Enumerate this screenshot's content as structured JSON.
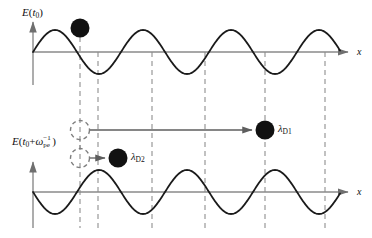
{
  "figure": {
    "background_color": "#ffffff",
    "width": 372,
    "height": 238
  },
  "colors": {
    "curve": "#1a1a1a",
    "axis": "#8a8a8a",
    "dashed": "#8f8f8f",
    "particle_fill": "#111111",
    "arrow": "#6f6f6f",
    "text": "#111111"
  },
  "panels": {
    "top": {
      "y_axis_label": {
        "E": "E",
        "open_paren": "(",
        "t": "t",
        "t_subscript": "0",
        "close_paren": ")"
      },
      "x_axis_label": "x",
      "baseline_y": 52,
      "amplitude": 22,
      "wavelength": 88,
      "phase_deg": 0
    },
    "bottom": {
      "y_axis_label": {
        "E": "E",
        "open_paren": "(",
        "t": "t",
        "t_subscript": "0",
        "plus": "+",
        "omega": "ω",
        "omega_subscript": "pe",
        "omega_superscript": "−1",
        "close_paren": ")"
      },
      "x_axis_label": "x",
      "baseline_y": 192,
      "amplitude": 22,
      "wavelength": 88,
      "phase_deg": 180
    }
  },
  "particles": [
    {
      "id": "top-particle",
      "name": "electron-top",
      "cx": 80,
      "cy": 28,
      "r": 9.5,
      "style": "filled"
    },
    {
      "id": "particle-d1",
      "name": "electron-displaced-far",
      "cx": 265,
      "cy": 130,
      "r": 9.5,
      "style": "filled"
    },
    {
      "id": "particle-d2",
      "name": "electron-displaced-near",
      "cx": 118,
      "cy": 158,
      "r": 9.5,
      "style": "filled"
    },
    {
      "id": "ghost-1",
      "name": "electron-origin-ghost-upper",
      "cx": 80,
      "cy": 130,
      "r": 9.5,
      "style": "dashed"
    },
    {
      "id": "ghost-2",
      "name": "electron-origin-ghost-lower",
      "cx": 80,
      "cy": 158,
      "r": 9.5,
      "style": "dashed"
    }
  ],
  "displacement_labels": [
    {
      "id": "lambda-d1",
      "symbol": "λ",
      "subscript": "D1",
      "x": 278,
      "y": 124
    },
    {
      "id": "lambda-d2",
      "symbol": "λ",
      "subscript": "D2",
      "x": 131,
      "y": 152
    }
  ],
  "displacement_arrows": [
    {
      "id": "arrow-d1",
      "name": "displacement-arrow-long",
      "x1": 90,
      "y1": 130,
      "x2": 254,
      "y2": 130
    },
    {
      "id": "arrow-d2",
      "name": "displacement-arrow-short",
      "x1": 90,
      "y1": 158,
      "x2": 107,
      "y2": 158
    }
  ],
  "guide_lines": [
    {
      "id": "g1",
      "x": 80,
      "y1": 28,
      "y2": 228
    },
    {
      "id": "g2",
      "x": 98,
      "y1": 52,
      "y2": 228
    },
    {
      "id": "g3",
      "x": 152,
      "y1": 52,
      "y2": 228
    },
    {
      "id": "g4",
      "x": 205,
      "y1": 52,
      "y2": 228
    },
    {
      "id": "g5",
      "x": 265,
      "y1": 52,
      "y2": 228
    },
    {
      "id": "g6",
      "x": 325,
      "y1": 52,
      "y2": 228
    }
  ],
  "connector": {
    "id": "ghost-connector",
    "name": "ghost-link-dashed",
    "x": 80,
    "y1": 139,
    "y2": 149
  }
}
